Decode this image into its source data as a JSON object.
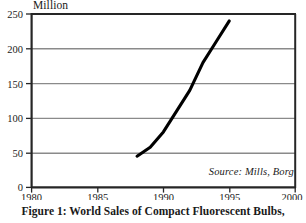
{
  "figure": {
    "caption": "Figure 1: World Sales of Compact Fluorescent Bulbs,",
    "source_note": "Source: Mills, Borg",
    "unit_label": "Million"
  },
  "chart_data": {
    "type": "line",
    "title": "World Sales of Compact Fluorescent Bulbs",
    "xlabel": "",
    "ylabel": "Million",
    "xlim": [
      1980,
      2000
    ],
    "ylim": [
      0,
      250
    ],
    "xticks": [
      "1980",
      "1985",
      "1990",
      "1995",
      "2000"
    ],
    "yticks": [
      "0",
      "50",
      "100",
      "150",
      "200",
      "250"
    ],
    "xtick_values": [
      1980,
      1985,
      1990,
      1995,
      2000
    ],
    "ytick_values": [
      0,
      50,
      100,
      150,
      200,
      250
    ],
    "grid": "horizontal",
    "legend": "none",
    "series": [
      {
        "name": "World sales of compact fluorescent bulbs",
        "color": "#000000",
        "x": [
          1988,
          1989,
          1990,
          1991,
          1992,
          1993,
          1994,
          1995
        ],
        "values": [
          45,
          58,
          80,
          110,
          140,
          180,
          210,
          240
        ]
      }
    ],
    "annotations": [
      {
        "text": "Source: Mills, Borg",
        "position": "bottom-right-inside-plot"
      },
      {
        "text": "Million",
        "position": "above-y-axis"
      }
    ]
  },
  "colors": {
    "line": "#111111",
    "grid": "#8a8a8a",
    "frame": "#262626",
    "text": "#1a1a1a",
    "background": "#ffffff"
  }
}
